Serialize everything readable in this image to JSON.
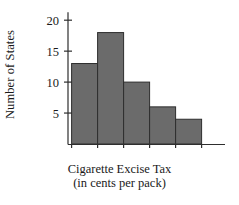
{
  "chart_data": {
    "type": "bar",
    "title": "",
    "xlabel": "Cigarette Excise Tax (in cents per pack)",
    "xlabel_line1": "Cigarette Excise Tax",
    "xlabel_line2": "(in cents per pack)",
    "ylabel": "Number of States",
    "categories": [
      "0-20",
      "20-40",
      "40-60",
      "60-80",
      "80-100"
    ],
    "bin_edges": [
      0,
      20,
      40,
      60,
      80,
      100
    ],
    "values": [
      13,
      18,
      10,
      6,
      4
    ],
    "bin_width": 20,
    "xlim": [
      -12,
      118
    ],
    "ylim": [
      0,
      21
    ],
    "xticks": [
      0,
      20,
      40,
      60,
      80,
      100
    ],
    "xtick_labels": [
      "0",
      "20",
      "40",
      "60",
      "80",
      "100"
    ],
    "yticks": [
      5,
      10,
      15,
      20
    ],
    "ytick_labels": [
      "5",
      "10",
      "15",
      "20"
    ],
    "grid": false,
    "legend": false,
    "bar_fill_color": "#6b6b6b",
    "bar_edge_color": "#2e2e2e",
    "axis_color": "#2e2e2e",
    "background_color": "#ffffff"
  }
}
